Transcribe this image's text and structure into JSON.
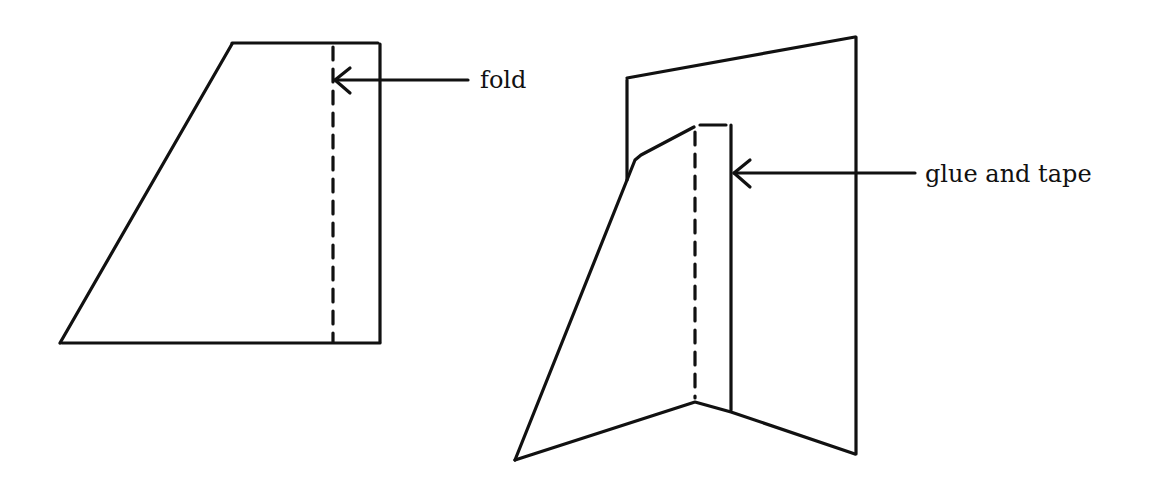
{
  "diagram": {
    "left_figure": {
      "description": "flat trapezoid cutout with dashed fold line near right edge",
      "annotation": {
        "label": "fold"
      }
    },
    "right_figure": {
      "description": "folded piece glued and taped to a vertical back panel",
      "annotation": {
        "label": "glue and tape"
      }
    },
    "colors": {
      "line": "#111111",
      "background": "#ffffff"
    }
  }
}
